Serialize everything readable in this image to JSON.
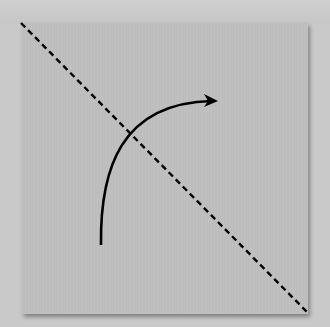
{
  "diagram": {
    "paper": {
      "color": "#bdbdbd",
      "x": 22,
      "y": 23,
      "width": 286,
      "height": 291
    },
    "fold_line": {
      "style": "dashed",
      "color": "#000000",
      "from": [
        21,
        23
      ],
      "to": [
        308,
        313
      ]
    },
    "fold_arrow": {
      "color": "#000000",
      "start": [
        101,
        245
      ],
      "end": [
        218,
        100
      ],
      "head": "right"
    }
  }
}
